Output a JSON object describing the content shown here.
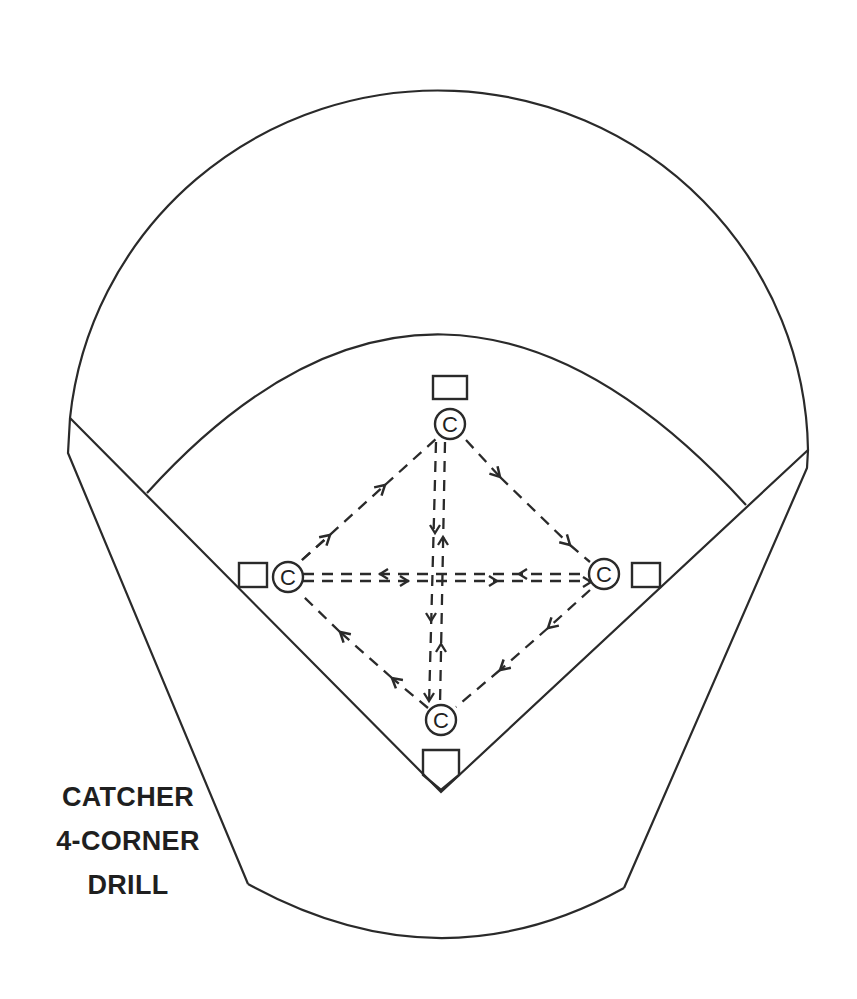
{
  "title": {
    "lines": [
      "CATCHER",
      "4-CORNER",
      "DRILL"
    ]
  },
  "colors": {
    "line": "#2a2a2a",
    "background": "#ffffff",
    "text": "#1f1f1f"
  },
  "players": [
    {
      "id": "top",
      "label": "C",
      "position": "second base"
    },
    {
      "id": "left",
      "label": "C",
      "position": "third base"
    },
    {
      "id": "right",
      "label": "C",
      "position": "first base"
    },
    {
      "id": "bottom",
      "label": "C",
      "position": "home plate"
    }
  ],
  "bases": [
    "second-base",
    "third-base",
    "first-base",
    "home-plate"
  ],
  "throw_paths": [
    {
      "from": "left",
      "to": "top",
      "style": "dashed",
      "direction": "toward top"
    },
    {
      "from": "top",
      "to": "right",
      "style": "dashed",
      "direction": "toward right"
    },
    {
      "from": "right",
      "to": "bottom",
      "style": "dashed",
      "direction": "toward bottom"
    },
    {
      "from": "bottom",
      "to": "left",
      "style": "dashed",
      "direction": "toward left"
    },
    {
      "from": "left",
      "to": "right",
      "style": "double-dashed",
      "direction": "both"
    },
    {
      "from": "top",
      "to": "bottom",
      "style": "double-dashed",
      "direction": "both"
    }
  ]
}
